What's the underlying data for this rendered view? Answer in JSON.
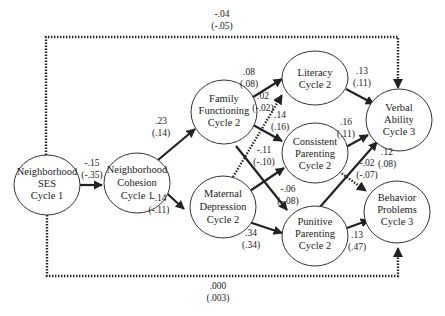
{
  "diagram": {
    "type": "path-model",
    "nodes": [
      {
        "id": "ses",
        "lines": [
          "Neighborhood",
          "SES",
          "Cycle 1"
        ]
      },
      {
        "id": "cohesion",
        "lines": [
          "Neighborhood",
          "Cohesion",
          "Cycle 1"
        ]
      },
      {
        "id": "family",
        "lines": [
          "Family",
          "Functioning",
          "Cycle 2"
        ]
      },
      {
        "id": "maternal",
        "lines": [
          "Maternal",
          "Depression",
          "Cycle 2"
        ]
      },
      {
        "id": "literacy",
        "lines": [
          "Literacy",
          "Cycle 2"
        ]
      },
      {
        "id": "consistent",
        "lines": [
          "Consistent",
          "Parenting",
          "Cycle 2"
        ]
      },
      {
        "id": "punitive",
        "lines": [
          "Punitive",
          "Parenting",
          "Cycle 2"
        ]
      },
      {
        "id": "verbal",
        "lines": [
          "Verbal",
          "Ability",
          "Cycle 3"
        ]
      },
      {
        "id": "behavior",
        "lines": [
          "Behavior",
          "Problems",
          "Cycle 3"
        ]
      }
    ],
    "edges": [
      {
        "from": "ses",
        "to": "verbal",
        "style": "dotted",
        "coef": "-.04",
        "coef2": "(-.05)"
      },
      {
        "from": "ses",
        "to": "cohesion",
        "style": "solid",
        "coef": "-.15",
        "coef2": "(-.35)"
      },
      {
        "from": "ses",
        "to": "behavior",
        "style": "dotted",
        "coef": ".000",
        "coef2": "(.003)"
      },
      {
        "from": "cohesion",
        "to": "family",
        "style": "solid",
        "coef": ".23",
        "coef2": "(.14)"
      },
      {
        "from": "cohesion",
        "to": "maternal",
        "style": "solid",
        "coef": "-.14",
        "coef2": "(-.11)"
      },
      {
        "from": "family",
        "to": "literacy",
        "style": "solid",
        "coef": ".08",
        "coef2": "(.08)"
      },
      {
        "from": "family",
        "to": "consistent",
        "style": "solid",
        "coef": ".02",
        "coef2": "(-.02)"
      },
      {
        "from": "family",
        "to": "punitive",
        "style": "solid",
        "coef": "-.11",
        "coef2": "(-.10)"
      },
      {
        "from": "maternal",
        "to": "literacy",
        "style": "dotted",
        "coef": ".14",
        "coef2": "(.16)"
      },
      {
        "from": "maternal",
        "to": "consistent",
        "style": "solid",
        "coef": "-.06",
        "coef2": "(-.08)"
      },
      {
        "from": "maternal",
        "to": "punitive",
        "style": "solid",
        "coef": ".34",
        "coef2": "(.34)"
      },
      {
        "from": "literacy",
        "to": "verbal",
        "style": "solid",
        "coef": ".13",
        "coef2": "(.11)"
      },
      {
        "from": "consistent",
        "to": "verbal",
        "style": "solid",
        "coef": ".16",
        "coef2": "(.11)"
      },
      {
        "from": "consistent",
        "to": "behavior",
        "style": "dotted",
        "coef": "-.02",
        "coef2": "(-.07)"
      },
      {
        "from": "punitive",
        "to": "verbal",
        "style": "solid",
        "coef": ".12",
        "coef2": "(.08)"
      },
      {
        "from": "punitive",
        "to": "behavior",
        "style": "solid",
        "coef": ".13",
        "coef2": "(.47)"
      }
    ]
  },
  "labels": {
    "ses_verbal": {
      "a": "-.04",
      "b": "(-.05)"
    },
    "ses_cohesion": {
      "a": "-.15",
      "b": "(-.35)"
    },
    "ses_behavior": {
      "a": ".000",
      "b": "(.003)"
    },
    "cohesion_family": {
      "a": ".23",
      "b": "(.14)"
    },
    "cohesion_maternal": {
      "a": "-.14",
      "b": "(-.11)"
    },
    "family_literacy": {
      "a": ".08",
      "b": "(.08)"
    },
    "family_consistent": {
      "a": ".02",
      "b": "(-.02)"
    },
    "maternal_literacy": {
      "a": ".14",
      "b": "(.16)"
    },
    "family_punitive": {
      "a": "-.11",
      "b": "(-.10)"
    },
    "maternal_consistent": {
      "a": "-.06",
      "b": "(-.08)"
    },
    "maternal_punitive": {
      "a": ".34",
      "b": "(.34)"
    },
    "literacy_verbal": {
      "a": ".13",
      "b": "(.11)"
    },
    "consistent_verbal": {
      "a": ".16",
      "b": "(.11)"
    },
    "punitive_verbal": {
      "a": ".12",
      "b": "(.08)"
    },
    "consistent_behavior": {
      "a": "-.02",
      "b": "(-.07)"
    },
    "punitive_behavior": {
      "a": ".13",
      "b": "(.47)"
    }
  },
  "nodes": {
    "ses": {
      "l1": "Neighborhood",
      "l2": "SES",
      "l3": "Cycle 1"
    },
    "cohesion": {
      "l1": "Neighborhood",
      "l2": "Cohesion",
      "l3": "Cycle 1"
    },
    "family": {
      "l1": "Family",
      "l2": "Functioning",
      "l3": "Cycle 2"
    },
    "maternal": {
      "l1": "Maternal",
      "l2": "Depression",
      "l3": "Cycle 2"
    },
    "literacy": {
      "l1": "Literacy",
      "l2": "Cycle 2"
    },
    "consistent": {
      "l1": "Consistent",
      "l2": "Parenting",
      "l3": "Cycle 2"
    },
    "punitive": {
      "l1": "Punitive",
      "l2": "Parenting",
      "l3": "Cycle 2"
    },
    "verbal": {
      "l1": "Verbal",
      "l2": "Ability",
      "l3": "Cycle 3"
    },
    "behavior": {
      "l1": "Behavior",
      "l2": "Problems",
      "l3": "Cycle 3"
    }
  }
}
